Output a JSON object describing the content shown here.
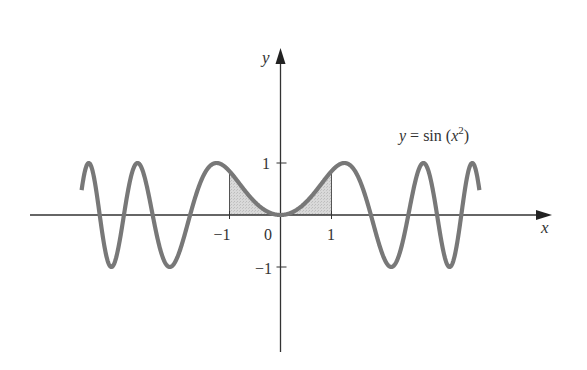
{
  "chart_data": {
    "type": "line",
    "title": "",
    "function_label": {
      "lhs": "y",
      "eq": " = sin (",
      "var": "x",
      "exp": "2",
      "close": ")"
    },
    "xlabel": "x",
    "ylabel": "y",
    "x_ticks": [
      {
        "value": -1,
        "label": "−1"
      },
      {
        "value": 0,
        "label": "0"
      },
      {
        "value": 1,
        "label": "1"
      }
    ],
    "y_ticks": [
      {
        "value": 1,
        "label": "1"
      },
      {
        "value": -1,
        "label": "−1"
      }
    ],
    "domain": [
      -3.9,
      3.9
    ],
    "xlim": [
      -4.9,
      5.3
    ],
    "ylim": [
      -2.7,
      3.2
    ],
    "grid": false,
    "legend": "none",
    "series": [
      {
        "name": "y = sin(x^2)",
        "expression": "sin(x^2)",
        "x_range": [
          -3.9,
          3.9
        ],
        "color": "#787878"
      }
    ],
    "shaded_region": {
      "x_from": -1,
      "x_to": 1,
      "between": [
        "y = sin(x^2)",
        "y = 0"
      ],
      "color": "#d2d2d2"
    }
  },
  "colors": {
    "curve": "#787878",
    "fill": "#d2d2d2",
    "axis": "#333333"
  }
}
